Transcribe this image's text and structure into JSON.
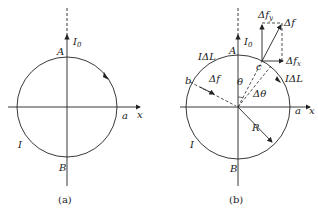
{
  "figure_a": {
    "caption": "(a)",
    "labels": {
      "current_I0": "I",
      "current_I0_sub": "0",
      "point_A": "A",
      "point_B": "B",
      "point_a": "a",
      "axis_x": "x",
      "loop_current": "I"
    }
  },
  "figure_b": {
    "caption": "(b)",
    "labels": {
      "current_I0": "I",
      "current_I0_sub": "0",
      "point_A": "A",
      "point_B": "B",
      "point_a": "a",
      "point_b": "b",
      "point_c": "c",
      "axis_x": "x",
      "loop_current": "I",
      "element_IdL_left": "IΔL",
      "element_IdL_right": "IΔL",
      "theta": "θ",
      "delta_theta": "Δθ",
      "radius": "R",
      "force_left": "Δf",
      "force_right": "Δf",
      "force_x": "Δf",
      "force_x_sub": "x",
      "force_y": "Δf",
      "force_y_sub": "y"
    }
  }
}
